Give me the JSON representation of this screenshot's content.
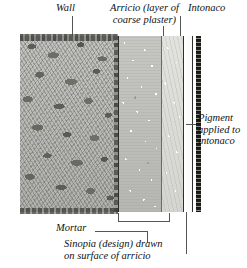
{
  "figure": {
    "title_top_left": "Wall",
    "title_top_mid": "Arricio (layer of\ncoarse plaster)",
    "title_top_right": "Intonaco",
    "right_label": "Pigment\napplied to\nintonaco",
    "bottom_left_label": "Mortar",
    "bottom_caption": "Sinopia (design) drawn\non surface of arricio"
  },
  "layers": [
    {
      "name": "wall",
      "label": "Wall",
      "color": "#b9b9b7",
      "description": "rubble masonry wall"
    },
    {
      "name": "arricio",
      "label": "Arricio",
      "color": "#bfbfbd",
      "description": "layer of coarse plaster"
    },
    {
      "name": "sinopia",
      "label": "Sinopia",
      "color": "#dcdcd9",
      "description": "design drawn on surface of arricio"
    },
    {
      "name": "intonaco",
      "label": "Intonaco",
      "color": "#fbfbfa",
      "description": "fine lime plaster"
    },
    {
      "name": "pigment",
      "label": "Pigment",
      "color": "#2a2a28",
      "description": "pigment applied to intonaco"
    }
  ],
  "colors": {
    "background": "#ffffff",
    "ink": "#111111",
    "leader": "#555555"
  }
}
